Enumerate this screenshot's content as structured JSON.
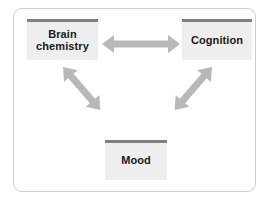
{
  "diagram": {
    "frame": {
      "border_color": "#cfcfcf",
      "background": "#ffffff"
    },
    "node_style": {
      "fill": "#eeeeee",
      "accent_color": "#808080",
      "text_color": "#1a1a1a"
    },
    "arrow_color": "#b8b8b8",
    "nodes": [
      {
        "id": "brain-chemistry",
        "label": "Brain\nchemistry"
      },
      {
        "id": "cognition",
        "label": "Cognition"
      },
      {
        "id": "mood",
        "label": "Mood"
      }
    ],
    "connections": [
      {
        "id": "brain-cognition",
        "from": "brain-chemistry",
        "to": "cognition",
        "style": "double-headed",
        "direction": "horizontal"
      },
      {
        "id": "brain-mood",
        "from": "brain-chemistry",
        "to": "mood",
        "style": "double-headed",
        "direction": "diagonal"
      },
      {
        "id": "cognition-mood",
        "from": "cognition",
        "to": "mood",
        "style": "double-headed",
        "direction": "diagonal"
      }
    ]
  }
}
